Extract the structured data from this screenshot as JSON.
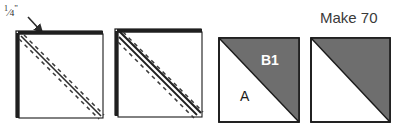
{
  "figure": {
    "title_text": "Make 70",
    "seam_allowance": {
      "numerator": "1",
      "slash": "⁄",
      "denominator": "4",
      "unit": "\""
    },
    "patch_labels": {
      "light": "A",
      "dark": "B1"
    },
    "colors": {
      "dark_fabric": "#6e6e6e",
      "light_fabric": "#ffffff",
      "outline": "#1a1a1a",
      "stitch_line": "#3a3a3a",
      "text": "#2b2b2b"
    },
    "steps": [
      {
        "name": "marked-square",
        "description": "Square with single marked diagonal stitching line",
        "x": 18,
        "y": 33,
        "size": 84
      },
      {
        "name": "stitched-square",
        "description": "Square stitched on both sides of the marked diagonal line",
        "x": 117,
        "y": 31,
        "size": 84
      },
      {
        "name": "pressed-unit-labeled",
        "description": "Finished half-square triangle unit with A and B1 labeled",
        "x": 219,
        "y": 38,
        "size": 80
      },
      {
        "name": "pressed-unit-plain",
        "description": "Finished half-square triangle unit",
        "x": 311,
        "y": 38,
        "size": 79
      }
    ]
  }
}
